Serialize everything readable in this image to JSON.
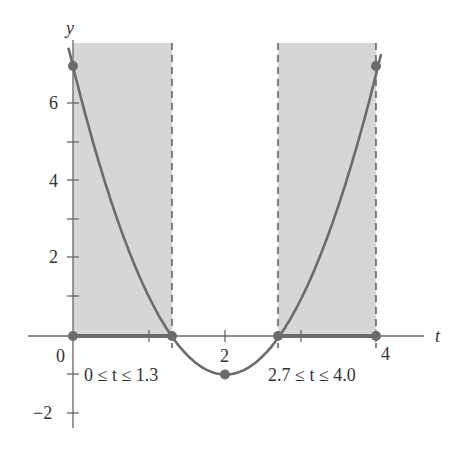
{
  "chart_data": {
    "type": "line",
    "title": "",
    "function": "f(t) = 2t^2 - 8t + 7",
    "xlabel": "t",
    "ylabel": "y",
    "xlim": [
      -0.6,
      4.8
    ],
    "ylim": [
      -2.5,
      7.5
    ],
    "x_ticks": [
      0,
      1,
      2,
      3,
      4
    ],
    "x_tick_labels": [
      "0",
      "",
      "2",
      "",
      "4"
    ],
    "y_ticks": [
      -2,
      -1,
      1,
      2,
      3,
      4,
      5,
      6
    ],
    "y_tick_labels": [
      "−2",
      "",
      "",
      "2",
      "",
      "4",
      "",
      "6"
    ],
    "grid": false,
    "series": [
      {
        "name": "curve",
        "x": [
          0,
          0.5,
          1.0,
          1.29,
          1.5,
          2.0,
          2.5,
          2.71,
          3.0,
          3.5,
          4.0
        ],
        "y": [
          7,
          3.5,
          1,
          0,
          -0.5,
          -1,
          -0.5,
          0,
          1,
          3.5,
          7
        ]
      }
    ],
    "highlighted_points": [
      {
        "x": 0,
        "y": 7
      },
      {
        "x": 0,
        "y": 0
      },
      {
        "x": 1.3,
        "y": 0
      },
      {
        "x": 2,
        "y": -1
      },
      {
        "x": 2.7,
        "y": 0
      },
      {
        "x": 4.0,
        "y": 0
      },
      {
        "x": 4.0,
        "y": 7
      }
    ],
    "shaded_intervals": [
      {
        "from": 0,
        "to": 1.3,
        "label": "0 ≤ t ≤ 1.3"
      },
      {
        "from": 2.7,
        "to": 4.0,
        "label": "2.7 ≤ t ≤ 4.0"
      }
    ],
    "annotations": [
      "0 ≤ t ≤ 1.3",
      "2.7 ≤ t ≤ 4.0"
    ],
    "colors": {
      "curve": "#6b6b6b",
      "shade": "#d6d6d6",
      "axis": "#555555",
      "points": "#6b6b6b"
    }
  },
  "labels": {
    "y_axis": "y",
    "t_axis": "t",
    "origin": "0",
    "x2": "2",
    "x4": "4",
    "y6": "6",
    "y4": "4",
    "y2": "2",
    "yneg2": "−2",
    "interval1": "0 ≤ t ≤ 1.3",
    "interval2": "2.7 ≤ t ≤ 4.0"
  }
}
